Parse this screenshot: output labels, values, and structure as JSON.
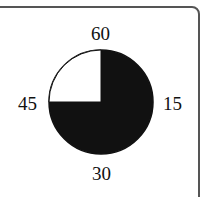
{
  "diagram": {
    "type": "clock-pie",
    "labels": {
      "top": "60",
      "right": "15",
      "bottom": "30",
      "left": "45"
    },
    "shaded_fraction": 0.75,
    "shaded_from": "60",
    "shaded_to": "45",
    "colors": {
      "shaded": "#111111",
      "unshaded": "#ffffff",
      "outline": "#111111"
    }
  }
}
